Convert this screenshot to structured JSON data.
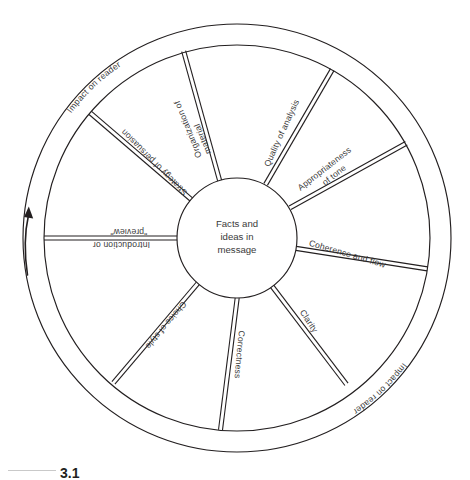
{
  "figure": {
    "caption_number": "3.1",
    "hub": {
      "line1": "Facts and",
      "line2": "ideas in",
      "line3": "message"
    },
    "arrow": {
      "name": "rotation-arrow",
      "direction": "counterclockwise"
    },
    "ring_labels": [
      {
        "id": "ring-top",
        "text": "Impact on reader"
      },
      {
        "id": "ring-bottom",
        "text": "Impact on reader"
      }
    ],
    "spokes": [
      {
        "id": "organization-of-material",
        "line1": "Organization of",
        "line2": "material"
      },
      {
        "id": "quality-of-analysis",
        "line1": "Quality of analysis",
        "line2": ""
      },
      {
        "id": "appropriateness-of-tone",
        "line1": "Appropriateness",
        "line2": "of tone"
      },
      {
        "id": "coherence-and-flow",
        "line1": "Coherence and flow",
        "line2": ""
      },
      {
        "id": "clarity",
        "line1": "Clarity",
        "line2": ""
      },
      {
        "id": "correctness",
        "line1": "Correctness",
        "line2": ""
      },
      {
        "id": "choice-of-style",
        "line1": "Choice of style",
        "line2": ""
      },
      {
        "id": "introduction-or-preview",
        "line1": "Introduction or",
        "line2": "\"preview\""
      },
      {
        "id": "strategy-of-persuasion",
        "line1": "Strategy of persuasion",
        "line2": ""
      }
    ]
  }
}
